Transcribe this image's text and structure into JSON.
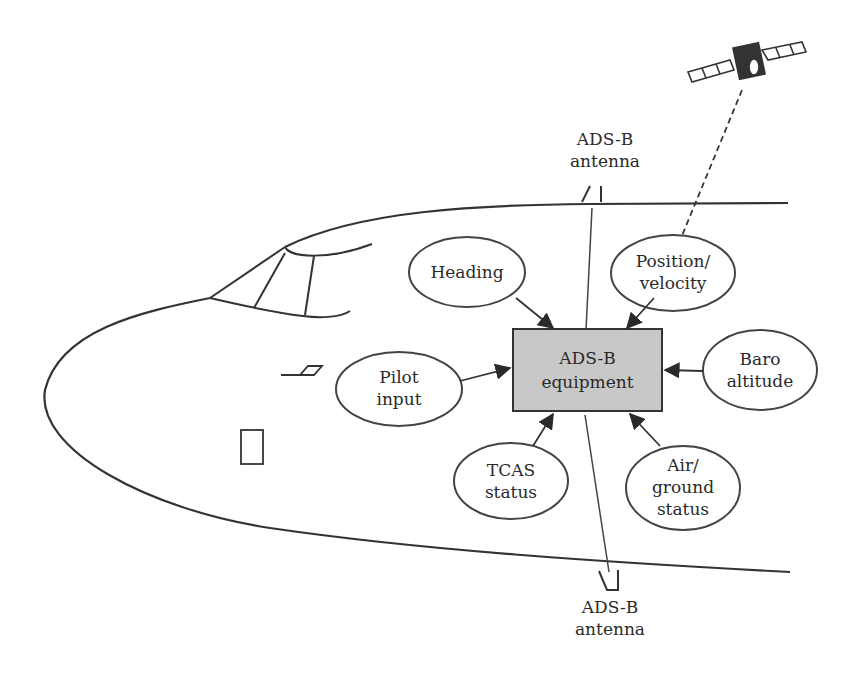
{
  "diagram": {
    "colors": {
      "stroke": "#333333",
      "box_fill": "#c8c8c8",
      "background": "#ffffff"
    },
    "center_node": {
      "line1": "ADS-B",
      "line2": "equipment"
    },
    "input_nodes": [
      {
        "id": "heading",
        "line1": "Heading",
        "line2": ""
      },
      {
        "id": "position",
        "line1": "Position/",
        "line2": "velocity"
      },
      {
        "id": "pilot",
        "line1": "Pilot",
        "line2": "input"
      },
      {
        "id": "baro",
        "line1": "Baro",
        "line2": "altitude"
      },
      {
        "id": "tcas",
        "line1": "TCAS",
        "line2": "status"
      },
      {
        "id": "airground",
        "line1": "Air/",
        "line2": "ground",
        "line3": "status"
      }
    ],
    "antennas": {
      "top": {
        "line1": "ADS-B",
        "line2": "antenna"
      },
      "bottom": {
        "line1": "ADS-B",
        "line2": "antenna"
      }
    },
    "satellite": {
      "icon": "satellite-icon"
    }
  }
}
